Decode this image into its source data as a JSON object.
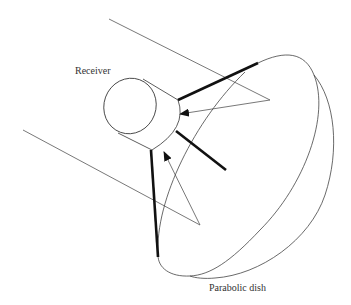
{
  "diagram": {
    "labels": {
      "receiver": "Receiver",
      "dish": "Parabolic dish"
    },
    "colors": {
      "background": "#ffffff",
      "thin_line": "#555555",
      "thick_line": "#111111",
      "text": "#333333"
    },
    "components": [
      "incoming-sunlight-rays",
      "reflected-rays",
      "receiver-cylinder",
      "support-struts",
      "parabolic-dish"
    ]
  }
}
